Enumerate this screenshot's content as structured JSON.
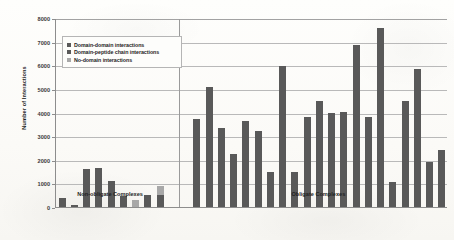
{
  "chart_data": {
    "type": "bar",
    "title": "",
    "xlabel": "",
    "ylabel": "Number of Interactions",
    "ylim": [
      0,
      8000
    ],
    "yticks": [
      0,
      1000,
      2000,
      3000,
      4000,
      5000,
      6000,
      7000,
      8000
    ],
    "grid": true,
    "legend_position": "upper-left-inside",
    "groups": [
      {
        "label": "Non-obligate Complexes",
        "values": [
          380,
          95,
          1590,
          1640,
          1090,
          450,
          310,
          500,
          880
        ],
        "series_of_values": [
          "domain-domain",
          "domain-domain",
          "domain-domain",
          "domain-domain",
          "domain-domain",
          "domain-domain",
          "no-domain",
          "domain-domain",
          "domain-peptide"
        ]
      },
      {
        "label": "Obligate Complexes",
        "values": [
          3720,
          5090,
          3330,
          2250,
          3660,
          3230,
          1480,
          5970,
          1480,
          3790,
          4500,
          3980,
          4040,
          6840,
          3790,
          7580,
          1080,
          4470,
          5830,
          1890,
          2400
        ]
      }
    ],
    "series": [
      {
        "name": "Domain-domain interactions",
        "color": "#595959"
      },
      {
        "name": "Domain-peptide chain interactions",
        "color": "#595959"
      },
      {
        "name": "No-domain interactions",
        "color": "#a8a8a8"
      }
    ]
  },
  "legend": {
    "items": [
      {
        "label": "Domain-domain interactions",
        "color": "#595959"
      },
      {
        "label": "Domain-peptide chain interactions",
        "color": "#595959"
      },
      {
        "label": "No-domain interactions",
        "color": "#a8a8a8"
      }
    ]
  },
  "axes": {
    "y_title": "Number of Interactions",
    "y_labels": [
      "8000",
      "7000",
      "6000",
      "5000",
      "4000",
      "3000",
      "2000",
      "1000",
      "0"
    ]
  },
  "x_groups": {
    "left": "Non-obligate Complexes",
    "right": "Obligate Complexes"
  }
}
